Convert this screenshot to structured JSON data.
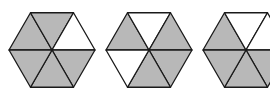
{
  "diagram": {
    "colors": {
      "shaded": "#b8b8b8",
      "unshaded": "#ffffff",
      "stroke": "#1a1a1a"
    },
    "hexagons": [
      {
        "cx": 52,
        "cy": 50,
        "r": 43,
        "shaded": [
          true,
          true,
          false,
          true,
          true,
          true
        ]
      },
      {
        "cx": 149,
        "cy": 50,
        "r": 43,
        "shaded": [
          true,
          false,
          true,
          true,
          true,
          false
        ]
      },
      {
        "cx": 246,
        "cy": 50,
        "r": 43,
        "shaded": [
          true,
          false,
          false,
          true,
          true,
          true
        ]
      }
    ],
    "segment_order": [
      "upper-left",
      "top",
      "upper-right",
      "lower-right",
      "bottom",
      "lower-left"
    ]
  }
}
